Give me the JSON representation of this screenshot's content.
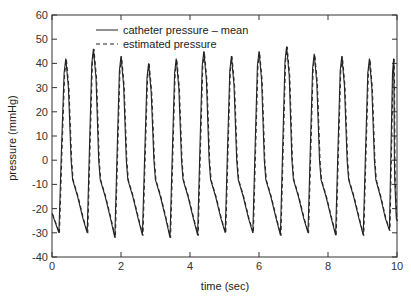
{
  "chart_data": {
    "type": "line",
    "title": "",
    "xlabel": "time (sec)",
    "ylabel": "pressure (mmHg)",
    "xlim": [
      0,
      10
    ],
    "ylim": [
      -40,
      60
    ],
    "xticks": [
      0,
      2,
      4,
      6,
      8,
      10
    ],
    "yticks": [
      -40,
      -30,
      -20,
      -10,
      0,
      10,
      20,
      30,
      40,
      50,
      60
    ],
    "grid": false,
    "legend_position": "upper left",
    "beats": {
      "peak_times": [
        0.4,
        1.2,
        2.0,
        2.8,
        3.6,
        4.4,
        5.2,
        6.0,
        6.8,
        7.6,
        8.4,
        9.2,
        9.9
      ],
      "peak_values": [
        42,
        46,
        43,
        40,
        42,
        45,
        43,
        45,
        47,
        44,
        43,
        42,
        42
      ],
      "trough_times": [
        0.2,
        1.02,
        1.82,
        2.62,
        3.42,
        4.22,
        5.02,
        5.82,
        6.62,
        7.42,
        8.22,
        9.02,
        9.78
      ],
      "trough_values": [
        -30,
        -30,
        -32,
        -31,
        -32,
        -31,
        -30,
        -30,
        -31,
        -30,
        -31,
        -31,
        -29
      ],
      "start_value": -22
    },
    "series": [
      {
        "name": "catheter pressure – mean",
        "style": "solid",
        "color": "#222222"
      },
      {
        "name": "estimated pressure",
        "style": "dashed",
        "color": "#222222"
      }
    ]
  },
  "legend": {
    "items": [
      {
        "label": "catheter pressure – mean"
      },
      {
        "label": "estimated pressure"
      }
    ]
  },
  "axes": {
    "xlabel": "time (sec)",
    "ylabel": "pressure (mmHg)",
    "xtick_labels": [
      "0",
      "2",
      "4",
      "6",
      "8",
      "10"
    ],
    "ytick_labels": [
      "-40",
      "-30",
      "-20",
      "-10",
      "0",
      "10",
      "20",
      "30",
      "40",
      "50",
      "60"
    ]
  }
}
